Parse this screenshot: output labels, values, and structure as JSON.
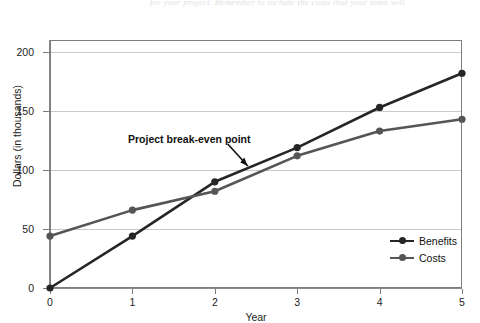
{
  "page": {
    "bleed_text_top": "for your project. Remember to include the costs that your team will",
    "bleed_text_second": ""
  },
  "chart_data": {
    "type": "line",
    "title": "",
    "xlabel": "Year",
    "ylabel": "Dollars (in thousands)",
    "x": [
      0,
      1,
      2,
      3,
      4,
      5
    ],
    "xticks": [
      "0",
      "1",
      "2",
      "3",
      "4",
      "5"
    ],
    "yticks": [
      "0",
      "50",
      "100",
      "150",
      "200"
    ],
    "ytick_values": [
      0,
      50,
      100,
      150,
      200
    ],
    "xlim": [
      0,
      5
    ],
    "ylim": [
      0,
      210
    ],
    "grid": "horizontal",
    "legend_position": "lower-right",
    "series": [
      {
        "name": "Benefits",
        "color": "#262626",
        "marker": "circle",
        "values": [
          0,
          44,
          90,
          119,
          153,
          182
        ]
      },
      {
        "name": "Costs",
        "color": "#555555",
        "marker": "circle",
        "values": [
          44,
          66,
          82,
          112,
          133,
          143
        ]
      }
    ],
    "annotations": [
      {
        "text": "Project break-even point",
        "x": 2.4,
        "y": 100,
        "arrow": "down-right"
      }
    ]
  },
  "legend": {
    "items": [
      {
        "label": "Benefits"
      },
      {
        "label": "Costs"
      }
    ]
  }
}
